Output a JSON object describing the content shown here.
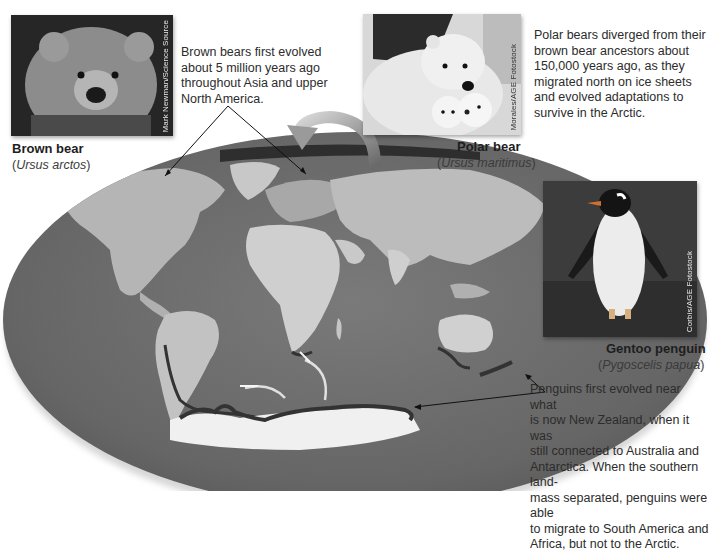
{
  "species": {
    "brown_bear": {
      "name": "Brown bear",
      "scientific": "Ursus arctos",
      "photo_credit": "Mark Newman/Science Source",
      "note": [
        "Brown bears first evolved",
        "about 5 million years ago",
        "throughout Asia and upper",
        "North America."
      ]
    },
    "polar_bear": {
      "name": "Polar bear",
      "scientific": "Ursus maritimus",
      "photo_credit": "Morales/AGE Fotostock",
      "note": [
        "Polar bears diverged from their",
        "brown bear ancestors about",
        "150,000 years ago, as they",
        "migrated north on ice sheets",
        "and evolved adaptations to",
        "survive in the Arctic."
      ]
    },
    "gentoo_penguin": {
      "name": "Gentoo penguin",
      "scientific": "Pygoscelis papua",
      "photo_credit": "Corbis/AGE Fotostock",
      "note": [
        "Penguins first evolved near what",
        "is now New Zealand, when it was",
        "still connected to Australia and",
        "Antarctica. When the southern land-",
        "mass separated, penguins were able",
        "to  migrate to South America and",
        "Africa, but not to the Arctic."
      ]
    }
  },
  "map": {
    "projection": "world map (elliptical)",
    "highlight_color": "#3a3a3a",
    "ocean_color": "#6f6f6f",
    "land_color": "#bdbdbd"
  },
  "paren_open": "(",
  "paren_close": ")"
}
